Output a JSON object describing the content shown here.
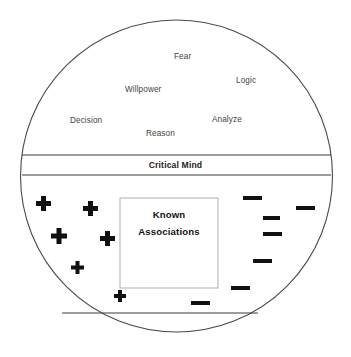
{
  "diagram": {
    "shape": "circle",
    "circle": {
      "cx": 176.5,
      "cy": 176,
      "rx": 156,
      "ry": 156,
      "stroke": "#4a4a4a",
      "fill": "#ffffff"
    },
    "conscious_region": {
      "name": "conscious-mind-region",
      "words": [
        {
          "label": "Fear",
          "x": 174,
          "y": 52
        },
        {
          "label": "Logic",
          "x": 236,
          "y": 76
        },
        {
          "label": "Willpower",
          "x": 125,
          "y": 85
        },
        {
          "label": "Decision",
          "x": 70,
          "y": 116
        },
        {
          "label": "Analyze",
          "x": 212,
          "y": 115
        },
        {
          "label": "Reason",
          "x": 146,
          "y": 129
        }
      ]
    },
    "critical_band": {
      "name": "critical-mind-band",
      "label": "Critical Mind",
      "top_line_y": 155,
      "bottom_line_y": 175,
      "label_y": 160
    },
    "known_box": {
      "name": "known-associations-box",
      "line1": "Known",
      "line2": "Associations",
      "x": 120,
      "y": 198,
      "w": 98,
      "h": 90,
      "stroke": "#b0b0b0",
      "line1_y": 209,
      "line2_y": 226
    },
    "bottom_chord": {
      "name": "subconscious-floor-line",
      "x1": 62,
      "x2": 258,
      "y": 313
    },
    "plus_marks": [
      {
        "x": 36,
        "y": 196,
        "size": 15
      },
      {
        "x": 83,
        "y": 201,
        "size": 15
      },
      {
        "x": 51,
        "y": 228,
        "size": 16
      },
      {
        "x": 100,
        "y": 231,
        "size": 15
      },
      {
        "x": 71,
        "y": 261,
        "size": 13
      },
      {
        "x": 114,
        "y": 290,
        "size": 12
      }
    ],
    "minus_marks": [
      {
        "x": 243,
        "y": 196,
        "w": 19,
        "h": 4
      },
      {
        "x": 296,
        "y": 206,
        "w": 19,
        "h": 4
      },
      {
        "x": 263,
        "y": 216,
        "w": 17,
        "h": 4
      },
      {
        "x": 263,
        "y": 232,
        "w": 19,
        "h": 4
      },
      {
        "x": 253,
        "y": 259,
        "w": 19,
        "h": 4
      },
      {
        "x": 231,
        "y": 286,
        "w": 19,
        "h": 4
      },
      {
        "x": 191,
        "y": 301,
        "w": 19,
        "h": 4
      }
    ],
    "colors": {
      "ink": "#1c1c1c",
      "outline": "#4a4a4a",
      "box_border": "#b0b0b0",
      "word": "#434343",
      "background": "#ffffff"
    }
  }
}
